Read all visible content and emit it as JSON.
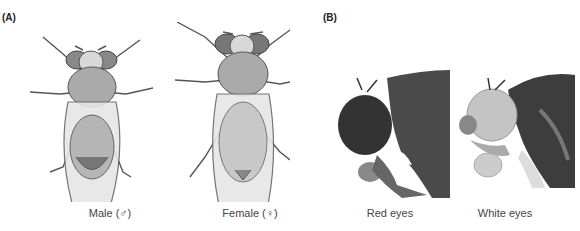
{
  "panels": {
    "a": {
      "label": "(A)",
      "figures": [
        {
          "caption": "Male (♂)",
          "subject": "male-fruit-fly-drawing"
        },
        {
          "caption": "Female (♀)",
          "subject": "female-fruit-fly-drawing"
        }
      ]
    },
    "b": {
      "label": "(B)",
      "figures": [
        {
          "caption": "Red eyes",
          "subject": "red-eyed-fly-head-photo"
        },
        {
          "caption": "White eyes",
          "subject": "white-eyed-fly-head-photo"
        }
      ]
    }
  }
}
